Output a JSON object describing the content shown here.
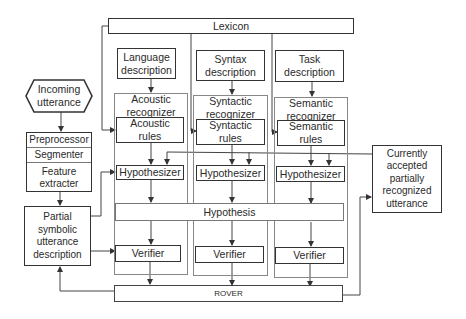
{
  "diagram": {
    "lexicon": "Lexicon",
    "inputs": {
      "incoming": "Incoming\nutterance",
      "preprocessor": "Preprocessor",
      "segmenter": "Segmenter",
      "feature_extracter": "Feature\nextracter",
      "partial_symbolic": "Partial\nsymbolic\nutterance\ndescription"
    },
    "columns": [
      {
        "description": "Language\ndescription",
        "recognizer": "Acoustic\nrecognizer",
        "rules": "Acoustic\nrules",
        "hypothesizer": "Hypothesizer",
        "verifier": "Verifier"
      },
      {
        "description": "Syntax\ndescription",
        "recognizer": "Syntactic\nrecognizer",
        "rules": "Syntactic\nrules",
        "hypothesizer": "Hypothesizer",
        "verifier": "Verifier"
      },
      {
        "description": "Task\ndescription",
        "recognizer": "Semantic\nrecognizer",
        "rules": "Semantic\nrules",
        "hypothesizer": "Hypothesizer",
        "verifier": "Verifier"
      }
    ],
    "hypothesis": "Hypothesis",
    "rover": "ROVER",
    "output": "Currently\naccepted\npartially\nrecognized\nutterance"
  }
}
